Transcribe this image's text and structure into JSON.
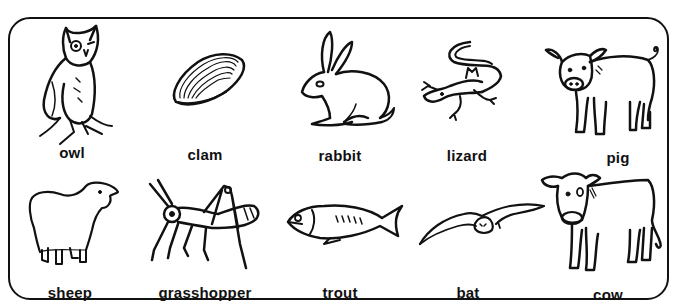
{
  "worksheet": {
    "rows": [
      {
        "animals": [
          {
            "name": "owl",
            "icon": "owl-icon"
          },
          {
            "name": "clam",
            "icon": "clam-icon"
          },
          {
            "name": "rabbit",
            "icon": "rabbit-icon"
          },
          {
            "name": "lizard",
            "icon": "lizard-icon"
          },
          {
            "name": "pig",
            "icon": "pig-icon"
          }
        ]
      },
      {
        "animals": [
          {
            "name": "sheep",
            "icon": "sheep-icon"
          },
          {
            "name": "grasshopper",
            "icon": "grasshopper-icon"
          },
          {
            "name": "trout",
            "icon": "trout-icon"
          },
          {
            "name": "bat",
            "icon": "bat-icon"
          },
          {
            "name": "cow",
            "icon": "cow-icon"
          }
        ]
      }
    ],
    "colors": {
      "ink": "#111111",
      "background": "#ffffff"
    }
  }
}
